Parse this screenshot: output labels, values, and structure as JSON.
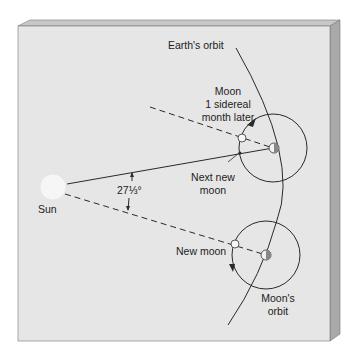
{
  "diagram": {
    "type": "astronomy-diagram",
    "labels": {
      "earths_orbit": "Earth's orbit",
      "moon_later_line1": "Moon",
      "moon_later_line2": "1 sidereal",
      "moon_later_line3": "month later",
      "next_new_line1": "Next new",
      "next_new_line2": "moon",
      "sun": "Sun",
      "angle": "27⅓°",
      "new_moon": "New moon",
      "moons_orbit_line1": "Moon's",
      "moons_orbit_line2": "orbit"
    },
    "colors": {
      "panel_face": "#e6e6e6",
      "panel_top": "#c8c8c8",
      "panel_side": "#a9a9a9",
      "line": "#2a2a2a",
      "sun": "#f6f6f6"
    }
  }
}
